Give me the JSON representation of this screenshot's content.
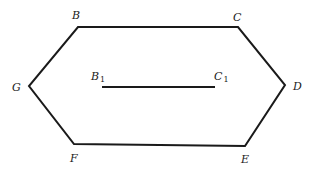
{
  "diagram": {
    "type": "geometry-figure",
    "stroke_color": "#1a1a1a",
    "background": "#ffffff",
    "vertices": [
      {
        "name": "B",
        "x": 78,
        "y": 27,
        "label_x": 72,
        "label_y": 19
      },
      {
        "name": "C",
        "x": 238,
        "y": 27,
        "label_x": 233,
        "label_y": 21
      },
      {
        "name": "D",
        "x": 285,
        "y": 85,
        "label_x": 293,
        "label_y": 90
      },
      {
        "name": "E",
        "x": 245,
        "y": 146,
        "label_x": 241,
        "label_y": 163
      },
      {
        "name": "F",
        "x": 74,
        "y": 144,
        "label_x": 70,
        "label_y": 162
      },
      {
        "name": "G",
        "x": 29,
        "y": 86,
        "label_x": 12,
        "label_y": 91
      }
    ],
    "inner_segment": {
      "start": {
        "name": "B",
        "subscript": "1",
        "x": 102,
        "y": 87,
        "label_x": 91,
        "label_y": 80
      },
      "end": {
        "name": "C",
        "subscript": "1",
        "x": 215,
        "y": 87,
        "label_x": 214,
        "label_y": 80
      }
    }
  }
}
